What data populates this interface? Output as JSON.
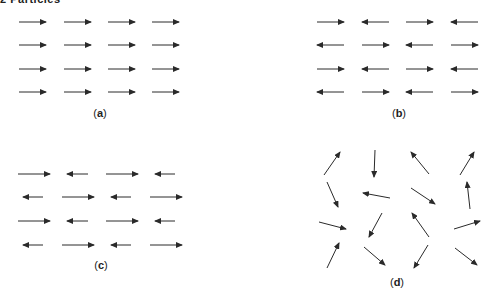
{
  "header": {
    "text": "2 Particles"
  },
  "style": {
    "arrow_color": "#2a2a2a",
    "label_color": "#222222",
    "background": "#ffffff"
  },
  "panels": [
    {
      "id": "a",
      "label": "a",
      "label_pos": [
        100,
        117
      ],
      "description": "ferromagnetic: all spins aligned right",
      "arrows": [
        [
          19,
          22,
          46,
          22
        ],
        [
          64,
          22,
          91,
          22
        ],
        [
          108,
          22,
          135,
          22
        ],
        [
          152,
          22,
          179,
          22
        ],
        [
          19,
          45,
          46,
          45
        ],
        [
          64,
          45,
          91,
          45
        ],
        [
          108,
          45,
          135,
          45
        ],
        [
          152,
          45,
          179,
          45
        ],
        [
          19,
          69,
          46,
          69
        ],
        [
          64,
          69,
          91,
          69
        ],
        [
          108,
          69,
          135,
          69
        ],
        [
          152,
          69,
          179,
          69
        ],
        [
          19,
          92,
          46,
          92
        ],
        [
          64,
          92,
          91,
          92
        ],
        [
          108,
          92,
          135,
          92
        ],
        [
          152,
          92,
          179,
          92
        ]
      ]
    },
    {
      "id": "b",
      "label": "b",
      "label_pos": [
        399,
        117
      ],
      "description": "antiferromagnetic: alternating spins, equal magnitude",
      "arrows": [
        [
          317,
          22,
          344,
          22
        ],
        [
          389,
          22,
          362,
          22
        ],
        [
          406,
          22,
          433,
          22
        ],
        [
          478,
          22,
          451,
          22
        ],
        [
          344,
          45,
          317,
          45
        ],
        [
          362,
          45,
          389,
          45
        ],
        [
          433,
          45,
          406,
          45
        ],
        [
          451,
          45,
          478,
          45
        ],
        [
          317,
          69,
          344,
          69
        ],
        [
          389,
          69,
          362,
          69
        ],
        [
          406,
          69,
          433,
          69
        ],
        [
          478,
          69,
          451,
          69
        ],
        [
          344,
          92,
          317,
          92
        ],
        [
          362,
          92,
          389,
          92
        ],
        [
          433,
          92,
          406,
          92
        ],
        [
          451,
          92,
          478,
          92
        ]
      ]
    },
    {
      "id": "c",
      "label": "c",
      "label_pos": [
        101,
        269
      ],
      "description": "ferrimagnetic: alternating spins, unequal magnitude",
      "arrows": [
        [
          18,
          174,
          50,
          174
        ],
        [
          88,
          174,
          67,
          174
        ],
        [
          106,
          174,
          138,
          174
        ],
        [
          175,
          174,
          155,
          174
        ],
        [
          43,
          197,
          23,
          197
        ],
        [
          62,
          197,
          94,
          197
        ],
        [
          131,
          197,
          111,
          197
        ],
        [
          150,
          197,
          182,
          197
        ],
        [
          18,
          221,
          50,
          221
        ],
        [
          88,
          221,
          67,
          221
        ],
        [
          106,
          221,
          138,
          221
        ],
        [
          175,
          221,
          155,
          221
        ],
        [
          43,
          245,
          23,
          245
        ],
        [
          62,
          245,
          94,
          245
        ],
        [
          131,
          245,
          111,
          245
        ],
        [
          150,
          245,
          182,
          245
        ]
      ]
    },
    {
      "id": "d",
      "label": "d",
      "label_pos": [
        397,
        286
      ],
      "description": "paramagnetic: random spin orientations",
      "arrows": [
        [
          324,
          175,
          340,
          152
        ],
        [
          375,
          150,
          374,
          177
        ],
        [
          429,
          174,
          411,
          152
        ],
        [
          460,
          175,
          474,
          152
        ],
        [
          327,
          182,
          338,
          207
        ],
        [
          390,
          198,
          363,
          193
        ],
        [
          411,
          188,
          435,
          204
        ],
        [
          470,
          209,
          467,
          182
        ],
        [
          319,
          222,
          346,
          229
        ],
        [
          382,
          213,
          369,
          237
        ],
        [
          429,
          237,
          412,
          213
        ],
        [
          454,
          229,
          480,
          221
        ],
        [
          327,
          268,
          339,
          243
        ],
        [
          364,
          247,
          385,
          265
        ],
        [
          428,
          245,
          414,
          268
        ],
        [
          455,
          248,
          477,
          265
        ]
      ]
    }
  ]
}
